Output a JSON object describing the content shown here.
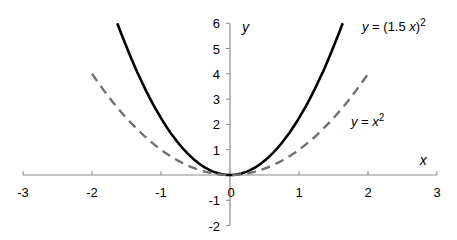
{
  "chart_data": {
    "type": "line",
    "title": "",
    "xlabel": "x",
    "ylabel": "y",
    "xlim": [
      -3,
      3
    ],
    "ylim": [
      -2,
      6
    ],
    "grid": false,
    "x_ticks": [
      "-3",
      "-2",
      "-1",
      "0",
      "1",
      "2",
      "3"
    ],
    "y_ticks": [
      "-2",
      "-1",
      "1",
      "2",
      "3",
      "4",
      "5",
      "6"
    ],
    "series": [
      {
        "name": "y = (1.5x)^2",
        "label_main": "y",
        "label_eq": " = (1.5 ",
        "label_var": "x",
        "label_close": ")",
        "label_sup": "2",
        "style": "solid",
        "color": "#000000",
        "x_range": [
          -1.633,
          1.633
        ],
        "x": [
          -1.633,
          -1.5,
          -1,
          -0.5,
          0,
          0.5,
          1,
          1.5,
          1.633
        ],
        "values": [
          6,
          5.06,
          2.25,
          0.56,
          0,
          0.56,
          2.25,
          5.06,
          6
        ]
      },
      {
        "name": "y = x^2",
        "label_main": "y",
        "label_eq": " = ",
        "label_var": "x",
        "label_sup": "2",
        "style": "dashed",
        "color": "#707070",
        "x_range": [
          -2,
          2
        ],
        "x": [
          -2,
          -1.5,
          -1,
          -0.5,
          0,
          0.5,
          1,
          1.5,
          2
        ],
        "values": [
          4,
          2.25,
          1,
          0.25,
          0,
          0.25,
          1,
          2.25,
          4
        ]
      }
    ]
  }
}
